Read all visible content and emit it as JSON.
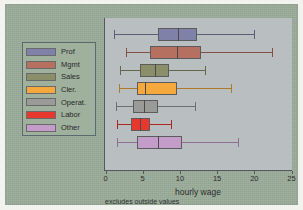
{
  "figure": {
    "xaxis_title": "hourly wage",
    "footnote": "excludes outside values",
    "plot_bg": "#b9bec1",
    "canvas_bg": "#9aab99",
    "axis_color": "#55585c"
  },
  "legend": {
    "items": [
      {
        "label": "Prof",
        "color": "#8081a8"
      },
      {
        "label": "Mgmt",
        "color": "#b5705f"
      },
      {
        "label": "Sales",
        "color": "#8a8f6a"
      },
      {
        "label": "Cler.",
        "color": "#f5a93c"
      },
      {
        "label": "Operat.",
        "color": "#9a9a98"
      },
      {
        "label": "Labor",
        "color": "#e8382d"
      },
      {
        "label": "Other",
        "color": "#c49cc9"
      }
    ]
  },
  "chart_data": {
    "type": "box",
    "title": "",
    "xlabel": "hourly wage",
    "ylabel": "",
    "xlim": [
      0,
      25
    ],
    "xticks": [
      0,
      5,
      10,
      15,
      20,
      25
    ],
    "xticklabels": [
      "0",
      "5",
      "10",
      "15",
      "20",
      "25"
    ],
    "grid": false,
    "orientation": "horizontal",
    "legend_position": "left-outside",
    "annotations": [
      "excludes outside values"
    ],
    "categories": [
      "Prof",
      "Mgmt",
      "Sales",
      "Cler.",
      "Operat.",
      "Labor",
      "Other"
    ],
    "boxes": [
      {
        "name": "Prof",
        "color": "#8081a8",
        "whisker_low": 1.2,
        "q1": 7.0,
        "median": 9.7,
        "q3": 12.3,
        "whisker_high": 20.0
      },
      {
        "name": "Mgmt",
        "color": "#b5705f",
        "whisker_low": 2.7,
        "q1": 6.0,
        "median": 9.6,
        "q3": 12.8,
        "whisker_high": 22.4
      },
      {
        "name": "Sales",
        "color": "#8a8f6a",
        "whisker_low": 2.0,
        "q1": 4.7,
        "median": 6.6,
        "q3": 8.5,
        "whisker_high": 13.4
      },
      {
        "name": "Cler.",
        "color": "#f5a93c",
        "whisker_low": 1.8,
        "q1": 4.3,
        "median": 5.3,
        "q3": 9.6,
        "whisker_high": 16.9
      },
      {
        "name": "Operat.",
        "color": "#9a9a98",
        "whisker_low": 1.4,
        "q1": 3.7,
        "median": 5.2,
        "q3": 7.0,
        "whisker_high": 12.0
      },
      {
        "name": "Labor",
        "color": "#e8382d",
        "whisker_low": 1.5,
        "q1": 3.4,
        "median": 4.7,
        "q3": 6.0,
        "whisker_high": 8.8
      },
      {
        "name": "Other",
        "color": "#c49cc9",
        "whisker_low": 1.5,
        "q1": 4.3,
        "median": 7.0,
        "q3": 10.3,
        "whisker_high": 17.8
      }
    ]
  }
}
